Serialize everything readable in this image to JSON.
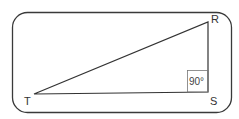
{
  "diagram": {
    "type": "right-triangle",
    "frame": {
      "x": 12,
      "y": 12,
      "width": 219,
      "height": 101,
      "radius": 15,
      "stroke": "#3a3a3a"
    },
    "vertices": {
      "R": {
        "label": "R",
        "x": 208,
        "y": 22
      },
      "S": {
        "label": "S",
        "x": 208,
        "y": 92
      },
      "T": {
        "label": "T",
        "x": 34,
        "y": 94
      }
    },
    "right_angle": {
      "vertex": "S",
      "label": "90°",
      "box_size": 21
    },
    "line_color": "#333333"
  }
}
